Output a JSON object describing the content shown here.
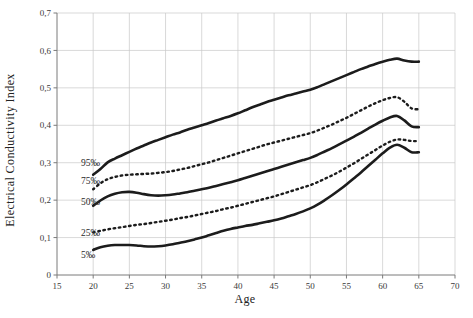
{
  "chart_data": {
    "type": "line",
    "title": "",
    "xlabel": "Age",
    "ylabel": "Electrical Conductivity Index",
    "xlim": [
      15,
      70
    ],
    "ylim": [
      0,
      0.7
    ],
    "xticks": [
      15,
      20,
      25,
      30,
      35,
      40,
      45,
      50,
      55,
      60,
      65,
      70
    ],
    "yticks": [
      0,
      0.1,
      0.2,
      0.3,
      0.4,
      0.5,
      0.6,
      0.7
    ],
    "xtick_labels": [
      "15",
      "20",
      "25",
      "30",
      "35",
      "40",
      "45",
      "50",
      "55",
      "60",
      "65",
      "70"
    ],
    "ytick_labels": [
      "0",
      "0,1",
      "0,2",
      "0,3",
      "0,4",
      "0,5",
      "0,6",
      "0,7"
    ],
    "grid": true,
    "legend_position": "inline-left-labels",
    "x": [
      20,
      21,
      22,
      23,
      24,
      25,
      26,
      27,
      28,
      29,
      30,
      31,
      32,
      33,
      34,
      35,
      36,
      37,
      38,
      39,
      40,
      41,
      42,
      43,
      44,
      45,
      46,
      47,
      48,
      49,
      50,
      51,
      52,
      53,
      54,
      55,
      56,
      57,
      58,
      59,
      60,
      61,
      62,
      63,
      64,
      65
    ],
    "series": [
      {
        "name": "95‰",
        "label": "95‰",
        "style": "solid",
        "values": [
          0.268,
          0.283,
          0.301,
          0.311,
          0.32,
          0.329,
          0.338,
          0.346,
          0.354,
          0.361,
          0.368,
          0.375,
          0.381,
          0.388,
          0.394,
          0.4,
          0.406,
          0.413,
          0.419,
          0.425,
          0.432,
          0.44,
          0.448,
          0.455,
          0.462,
          0.468,
          0.474,
          0.48,
          0.485,
          0.49,
          0.495,
          0.502,
          0.51,
          0.518,
          0.526,
          0.534,
          0.542,
          0.55,
          0.557,
          0.564,
          0.57,
          0.575,
          0.578,
          0.573,
          0.57,
          0.57
        ]
      },
      {
        "name": "75‰",
        "label": "75‰",
        "style": "dotted",
        "values": [
          0.229,
          0.245,
          0.256,
          0.262,
          0.266,
          0.268,
          0.269,
          0.27,
          0.271,
          0.273,
          0.275,
          0.278,
          0.282,
          0.286,
          0.291,
          0.296,
          0.301,
          0.307,
          0.313,
          0.319,
          0.325,
          0.331,
          0.337,
          0.343,
          0.349,
          0.354,
          0.359,
          0.364,
          0.369,
          0.374,
          0.379,
          0.386,
          0.394,
          0.402,
          0.411,
          0.42,
          0.43,
          0.44,
          0.45,
          0.459,
          0.467,
          0.473,
          0.475,
          0.463,
          0.445,
          0.443
        ]
      },
      {
        "name": "50‰",
        "label": "50‰",
        "style": "solid",
        "values": [
          0.185,
          0.199,
          0.21,
          0.217,
          0.221,
          0.222,
          0.22,
          0.216,
          0.213,
          0.212,
          0.213,
          0.215,
          0.218,
          0.221,
          0.225,
          0.229,
          0.233,
          0.238,
          0.243,
          0.248,
          0.253,
          0.259,
          0.265,
          0.271,
          0.277,
          0.283,
          0.289,
          0.295,
          0.301,
          0.307,
          0.313,
          0.321,
          0.33,
          0.339,
          0.349,
          0.359,
          0.369,
          0.38,
          0.391,
          0.402,
          0.412,
          0.421,
          0.425,
          0.413,
          0.397,
          0.395
        ]
      },
      {
        "name": "25‰",
        "label": "25‰",
        "style": "dotted",
        "values": [
          0.114,
          0.118,
          0.122,
          0.125,
          0.128,
          0.131,
          0.134,
          0.136,
          0.139,
          0.142,
          0.145,
          0.148,
          0.152,
          0.155,
          0.159,
          0.163,
          0.167,
          0.171,
          0.176,
          0.18,
          0.185,
          0.19,
          0.195,
          0.2,
          0.205,
          0.21,
          0.216,
          0.222,
          0.228,
          0.234,
          0.24,
          0.248,
          0.257,
          0.266,
          0.276,
          0.287,
          0.298,
          0.31,
          0.322,
          0.334,
          0.346,
          0.356,
          0.362,
          0.361,
          0.358,
          0.358
        ]
      },
      {
        "name": "5‰",
        "label": "5‰",
        "style": "solid",
        "values": [
          0.067,
          0.074,
          0.078,
          0.08,
          0.08,
          0.08,
          0.079,
          0.077,
          0.076,
          0.077,
          0.079,
          0.082,
          0.086,
          0.09,
          0.095,
          0.1,
          0.106,
          0.112,
          0.118,
          0.123,
          0.127,
          0.131,
          0.134,
          0.138,
          0.142,
          0.146,
          0.151,
          0.157,
          0.163,
          0.17,
          0.178,
          0.188,
          0.2,
          0.213,
          0.227,
          0.242,
          0.258,
          0.274,
          0.291,
          0.308,
          0.325,
          0.34,
          0.348,
          0.34,
          0.328,
          0.328
        ]
      }
    ],
    "inline_labels": [
      {
        "text": "95‰",
        "x": 18.3,
        "y": 0.3
      },
      {
        "text": "75‰",
        "x": 18.3,
        "y": 0.252
      },
      {
        "text": "50‰",
        "x": 18.3,
        "y": 0.196
      },
      {
        "text": "25‰",
        "x": 18.3,
        "y": 0.113
      },
      {
        "text": "5‰",
        "x": 18.3,
        "y": 0.055
      }
    ]
  },
  "colors": {
    "background": "#ffffff",
    "curve": "#1c1c1c",
    "grid": "#c9c9c9",
    "axis": "#7a7a7a",
    "text": "#222222"
  }
}
